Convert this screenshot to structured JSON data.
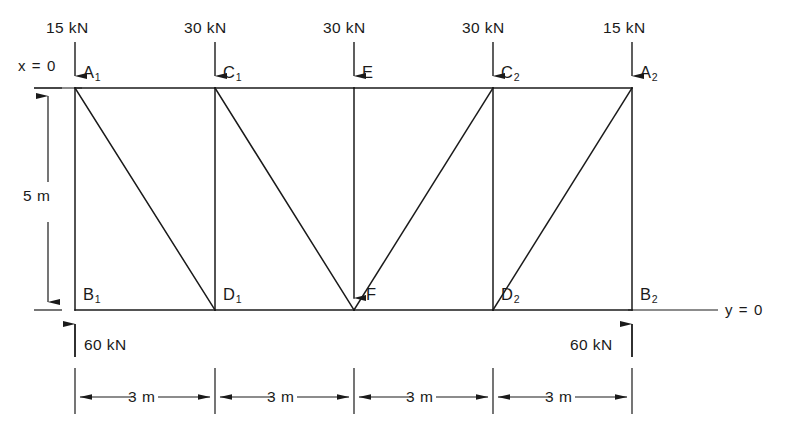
{
  "figure": {
    "type": "statics-truss-free-body-diagram",
    "stroke_color": "#1a1a1a",
    "background": "#ffffff"
  },
  "axes": {
    "x_origin_label": "x = 0",
    "y_origin_label": "y = 0"
  },
  "applied_loads": [
    {
      "id": "load-A1",
      "value": "15 kN",
      "node": "A1",
      "direction": "down"
    },
    {
      "id": "load-C1",
      "value": "30 kN",
      "node": "C1",
      "direction": "down"
    },
    {
      "id": "load-E",
      "value": "30 kN",
      "node": "E",
      "direction": "down"
    },
    {
      "id": "load-C2",
      "value": "30 kN",
      "node": "C2",
      "direction": "down"
    },
    {
      "id": "load-A2",
      "value": "15 kN",
      "node": "A2",
      "direction": "down"
    }
  ],
  "reactions": [
    {
      "id": "reaction-B1",
      "value": "60 kN",
      "node": "B1",
      "direction": "up"
    },
    {
      "id": "reaction-B2",
      "value": "60 kN",
      "node": "B2",
      "direction": "up"
    }
  ],
  "nodes": {
    "top_chord": [
      {
        "name": "A1",
        "label": "A",
        "sub": "1",
        "x": 75,
        "y": 88
      },
      {
        "name": "C1",
        "label": "C",
        "sub": "1",
        "x": 215,
        "y": 88
      },
      {
        "name": "E",
        "label": "E",
        "sub": "",
        "x": 354,
        "y": 88
      },
      {
        "name": "C2",
        "label": "C",
        "sub": "2",
        "x": 493,
        "y": 88
      },
      {
        "name": "A2",
        "label": "A",
        "sub": "2",
        "x": 632,
        "y": 88
      }
    ],
    "bottom_chord": [
      {
        "name": "B1",
        "label": "B",
        "sub": "1",
        "x": 75,
        "y": 310
      },
      {
        "name": "D1",
        "label": "D",
        "sub": "1",
        "x": 215,
        "y": 310
      },
      {
        "name": "F",
        "label": "F",
        "sub": "",
        "x": 354,
        "y": 310
      },
      {
        "name": "D2",
        "label": "D",
        "sub": "2",
        "x": 493,
        "y": 310
      },
      {
        "name": "B2",
        "label": "B",
        "sub": "2",
        "x": 632,
        "y": 310
      }
    ]
  },
  "members": {
    "top_chord": [
      "A1-C1",
      "C1-E",
      "E-C2",
      "C2-A2"
    ],
    "bottom_chord": [
      "B1-D1",
      "D1-F",
      "F-D2",
      "D2-B2"
    ],
    "verticals": [
      "A1-B1",
      "C1-D1",
      "E-F",
      "C2-D2",
      "A2-B2"
    ],
    "diagonals": [
      "A1-D1",
      "C1-F",
      "F-C2",
      "D2-A2"
    ]
  },
  "dimensions": {
    "height": {
      "label": "5 m",
      "from": "top_chord",
      "to": "bottom_chord"
    },
    "bays": [
      {
        "label": "3 m",
        "from": "B1",
        "to": "D1"
      },
      {
        "label": "3 m",
        "from": "D1",
        "to": "F"
      },
      {
        "label": "3 m",
        "from": "F",
        "to": "D2"
      },
      {
        "label": "3 m",
        "from": "D2",
        "to": "B2"
      }
    ]
  }
}
